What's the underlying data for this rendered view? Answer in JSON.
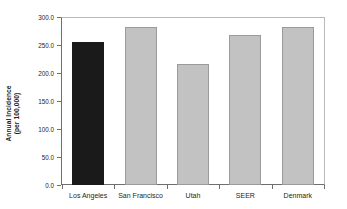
{
  "chart_data": {
    "type": "bar",
    "title": "",
    "xlabel": "",
    "ylabel": "Annual Incidence (per 100,000)",
    "ylabel_lines": [
      "Annual Incidence",
      "(per 100,000)"
    ],
    "categories": [
      "Los Angeles",
      "San Francisco",
      "Utah",
      "SEER",
      "Denmark"
    ],
    "values": [
      255,
      282,
      216,
      268,
      283
    ],
    "ylim": [
      0,
      300
    ],
    "ytick_values": [
      0,
      50,
      100,
      150,
      200,
      250,
      300
    ],
    "ytick_labels": [
      "0.0",
      "50.0",
      "100.0",
      "150.0",
      "200.0",
      "250.0",
      "300.0"
    ],
    "grid": false,
    "legend": "none",
    "bar_colors": [
      "#1a1a1a",
      "#c2c2c2",
      "#c2c2c2",
      "#c2c2c2",
      "#c2c2c2"
    ],
    "bar_border_colors": [
      "#1a1a1a",
      "#9a9a9a",
      "#9a9a9a",
      "#9a9a9a",
      "#9a9a9a"
    ],
    "highlight_category": "Los Angeles",
    "axis_color": "#6f6f6f",
    "frame_color": "#b9b9b9",
    "background_color": "#ffffff",
    "text_color": "#231f20"
  }
}
